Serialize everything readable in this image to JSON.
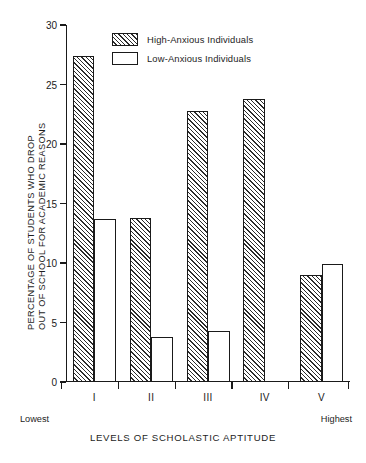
{
  "chart_data": {
    "type": "bar",
    "title": "",
    "xlabel": "LEVELS OF SCHOLASTIC APTITUDE",
    "ylabel": "PERCENTAGE OF STUDENTS WHO DROP OUT OF SCHOOL FOR ACADEMIC REASONS",
    "ylabel_lines": [
      "PERCENTAGE OF STUDENTS WHO DROP",
      "OUT OF SCHOOL FOR ACADEMIC REASONS"
    ],
    "categories": [
      "I",
      "II",
      "III",
      "IV",
      "V"
    ],
    "series": [
      {
        "name": "High-Anxious Individuals",
        "values": [
          27.4,
          13.8,
          22.8,
          23.8,
          9.0
        ],
        "fill": "hatched"
      },
      {
        "name": "Low-Anxious Individuals",
        "values": [
          13.7,
          3.8,
          4.3,
          0.0,
          9.9
        ],
        "fill": "white"
      }
    ],
    "ylim": [
      0,
      30
    ],
    "yticks": [
      0,
      5,
      10,
      15,
      20,
      25,
      30
    ],
    "ytick_labels": [
      "0",
      "5",
      "10",
      "15",
      "20",
      "25",
      "30"
    ],
    "grid": false,
    "legend_position": "top-center",
    "annotations": [
      {
        "text": "Lowest",
        "position": "below-axis-left"
      },
      {
        "text": "Highest",
        "position": "below-axis-right"
      }
    ]
  },
  "legend": {
    "items": [
      {
        "label": "High-Anxious Individuals",
        "swatch": "hatched-swatch"
      },
      {
        "label": "Low-Anxious Individuals",
        "swatch": "white-swatch"
      }
    ]
  },
  "axis": {
    "x_caption": "LEVELS OF SCHOLASTIC APTITUDE",
    "low_end": "Lowest",
    "high_end": "Highest"
  },
  "colors": {
    "ink": "#1a1a1a",
    "hatch": "#2b2b2b",
    "background": "#ffffff"
  }
}
